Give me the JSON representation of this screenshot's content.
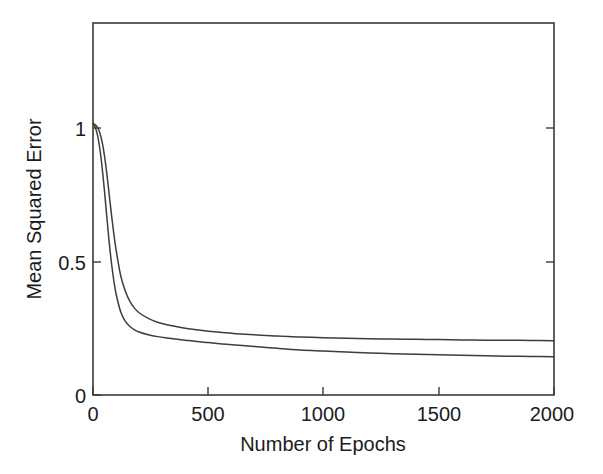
{
  "chart_data": {
    "type": "line",
    "title": "",
    "xlabel": "Number of Epochs",
    "ylabel": "Mean Squared Error",
    "xlim": [
      0,
      2000
    ],
    "ylim": [
      0,
      1.37
    ],
    "xticks": [
      0,
      500,
      1000,
      1500,
      2000
    ],
    "xtick_labels": [
      "0",
      "500",
      "1000",
      "1500",
      "2000"
    ],
    "yticks": [
      0,
      0.5,
      1
    ],
    "ytick_labels": [
      "0",
      "0.5",
      "1"
    ],
    "grid": false,
    "legend": "none",
    "line_color": "#3d3d3d",
    "frame_color": "#3a3a3a",
    "background": "#ffffff",
    "series": [
      {
        "name": "curve-upper",
        "note": "slower decay, higher asymptote",
        "asymptote": 0.2,
        "initial": 1.0,
        "x": [
          0,
          10,
          20,
          30,
          40,
          50,
          60,
          70,
          80,
          90,
          100,
          120,
          140,
          160,
          180,
          200,
          240,
          280,
          320,
          360,
          400,
          450,
          500,
          560,
          620,
          700,
          800,
          900,
          1000,
          1100,
          1200,
          1300,
          1400,
          1500,
          1600,
          1700,
          1800,
          1900,
          2000
        ],
        "y": [
          1.0,
          0.995,
          0.985,
          0.965,
          0.93,
          0.88,
          0.815,
          0.74,
          0.665,
          0.595,
          0.535,
          0.44,
          0.383,
          0.345,
          0.32,
          0.303,
          0.282,
          0.268,
          0.259,
          0.252,
          0.246,
          0.24,
          0.235,
          0.23,
          0.226,
          0.222,
          0.217,
          0.214,
          0.211,
          0.209,
          0.207,
          0.206,
          0.205,
          0.204,
          0.203,
          0.202,
          0.202,
          0.201,
          0.2
        ]
      },
      {
        "name": "curve-lower",
        "note": "faster decay, lower asymptote",
        "asymptote": 0.14,
        "initial": 1.0,
        "x": [
          0,
          10,
          20,
          30,
          40,
          50,
          60,
          70,
          80,
          90,
          100,
          120,
          140,
          160,
          180,
          200,
          240,
          280,
          320,
          360,
          400,
          450,
          500,
          560,
          620,
          700,
          800,
          900,
          1000,
          1100,
          1200,
          1300,
          1400,
          1500,
          1600,
          1700,
          1800,
          1900,
          2000
        ],
        "y": [
          1.0,
          0.985,
          0.955,
          0.905,
          0.835,
          0.75,
          0.655,
          0.565,
          0.487,
          0.423,
          0.373,
          0.307,
          0.272,
          0.252,
          0.24,
          0.232,
          0.222,
          0.215,
          0.21,
          0.206,
          0.202,
          0.197,
          0.193,
          0.188,
          0.184,
          0.179,
          0.172,
          0.166,
          0.162,
          0.158,
          0.155,
          0.152,
          0.15,
          0.148,
          0.146,
          0.145,
          0.143,
          0.142,
          0.141
        ]
      }
    ]
  }
}
